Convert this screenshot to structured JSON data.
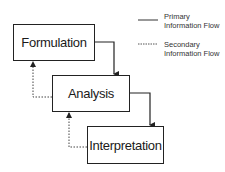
{
  "diagram": {
    "boxes": [
      {
        "id": "formulation",
        "label": "Formulation"
      },
      {
        "id": "analysis",
        "label": "Analysis"
      },
      {
        "id": "interpretation",
        "label": "Interpretation"
      }
    ],
    "edges": [
      {
        "from": "formulation",
        "to": "analysis",
        "style": "solid",
        "type": "primary"
      },
      {
        "from": "analysis",
        "to": "interpretation",
        "style": "solid",
        "type": "primary"
      },
      {
        "from": "analysis",
        "to": "formulation",
        "style": "dotted",
        "type": "secondary"
      },
      {
        "from": "interpretation",
        "to": "analysis",
        "style": "dotted",
        "type": "secondary"
      }
    ],
    "legend": {
      "primary": {
        "line1": "Primary",
        "line2": "Information Flow"
      },
      "secondary": {
        "line1": "Secondary",
        "line2": "Information Flow"
      }
    }
  }
}
